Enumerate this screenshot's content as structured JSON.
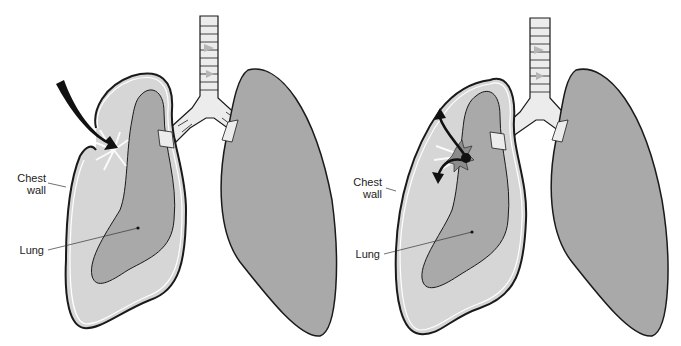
{
  "colors": {
    "background": "#ffffff",
    "pleural_space": "#d6d6d6",
    "lung_tissue": "#a9a9a9",
    "outline": "#1a1a1a",
    "trachea_light": "#ececec",
    "trachea_dark": "#b5b5b5",
    "arrow": "#111111",
    "tear": "#8c8c8c"
  },
  "panels": [
    {
      "id": "open-pneumothorax",
      "labels": {
        "chest_wall_line1": "Chest",
        "chest_wall_line2": "wall",
        "lung": "Lung"
      },
      "features": [
        "external-arrow-through-chest-wall",
        "collapsed-left-lung",
        "normal-right-lung",
        "trachea-bronchi"
      ]
    },
    {
      "id": "tension-pneumothorax",
      "labels": {
        "chest_wall_line1": "Chest",
        "chest_wall_line2": "wall",
        "lung": "Lung"
      },
      "features": [
        "internal-tear-bidirectional-arrows",
        "collapsed-left-lung",
        "normal-right-lung",
        "trachea-bronchi"
      ]
    }
  ]
}
